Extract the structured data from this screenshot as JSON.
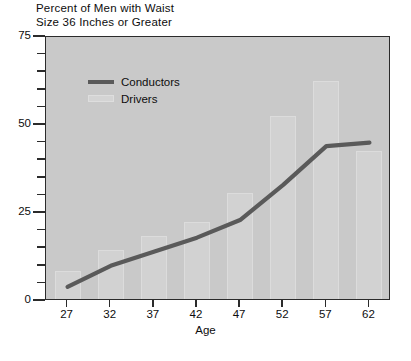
{
  "chart": {
    "title": "Percent of Men with Waist\nSize 36 Inches or Greater",
    "xlabel": "Age",
    "ylabel": "",
    "caption": ""
  },
  "legend": {
    "items": [
      {
        "label": "Conductors",
        "swatch": "line-swatch",
        "color": "#5a5a5a"
      },
      {
        "label": "Drivers",
        "swatch": "bar-swatch",
        "color": "#d2d2d2"
      }
    ]
  },
  "axes": {
    "y_major_labels": [
      "0",
      "25",
      "50",
      "75"
    ],
    "y_major_values": [
      0,
      25,
      50,
      75
    ],
    "y_minor_values": [
      5,
      10,
      15,
      20,
      30,
      35,
      40,
      45,
      55,
      60,
      65,
      70
    ],
    "x_labels": [
      "27",
      "32",
      "37",
      "42",
      "47",
      "52",
      "57",
      "62"
    ]
  },
  "colors": {
    "plot_background": "#c9c9c9",
    "frame": "#2b2b2b",
    "line": "#5a5a5a",
    "bar_fill": "#d2d2d2",
    "bar_edge": "#dcdcdc",
    "text": "#0d0d0d",
    "page_background": "#ffffff"
  },
  "chart_data": {
    "type": "bar",
    "title": "Percent of Men with Waist Size 36 Inches or Greater",
    "xlabel": "Age",
    "ylabel": "Percent of Men with Waist Size 36 Inches or Greater",
    "xlim": [
      24.5,
      64.5
    ],
    "ylim": [
      0,
      75
    ],
    "grid": false,
    "legend_position": "upper-left-inside",
    "categories": [
      "27",
      "32",
      "37",
      "42",
      "47",
      "52",
      "57",
      "62"
    ],
    "x": [
      27,
      32,
      37,
      42,
      47,
      52,
      57,
      62
    ],
    "series": [
      {
        "name": "Drivers",
        "type": "bar",
        "color": "#d2d2d2",
        "values": [
          8,
          14,
          18,
          22,
          30,
          52,
          62,
          42
        ]
      },
      {
        "name": "Conductors",
        "type": "line",
        "color": "#5a5a5a",
        "values": [
          4,
          10,
          14,
          18,
          23,
          33,
          44,
          45
        ]
      }
    ]
  }
}
